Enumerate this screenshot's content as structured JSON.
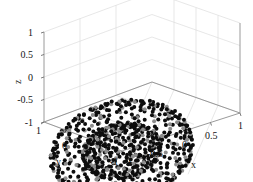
{
  "figure": {
    "kind": "matlab-3d-scatter",
    "background_color": "#ffffff",
    "grid_color": "#d8d8d8",
    "axis_color": "#9a9a9a",
    "marker_colors": {
      "primary": "#0d0d0d",
      "secondary": "#8c8c8c"
    }
  },
  "axes": {
    "x": {
      "name": "x",
      "ticks": [
        "-1",
        "-0.5",
        "0",
        "0.5",
        "1"
      ],
      "tick_values": [
        -1,
        -0.5,
        0,
        0.5,
        1
      ],
      "limits": [
        -1,
        1
      ]
    },
    "y": {
      "name": "y",
      "ticks": [
        "1",
        "0",
        "-1"
      ],
      "tick_values": [
        1,
        0,
        -1
      ],
      "limits": [
        -1,
        1
      ]
    },
    "z": {
      "name": "z",
      "ticks": [
        "1",
        "0.5",
        "0",
        "-0.5",
        "-1"
      ],
      "tick_values": [
        1,
        0.5,
        0,
        -0.5,
        -1
      ],
      "limits": [
        -1,
        1
      ]
    }
  },
  "chart_data": {
    "type": "scatter",
    "title": "",
    "xlabel": "x",
    "ylabel": "y",
    "zlabel": "z",
    "xlim": [
      -1,
      1
    ],
    "ylim": [
      -1,
      1
    ],
    "zlim": [
      -1,
      1
    ],
    "grid": true,
    "legend": null,
    "projection": "3d",
    "view": {
      "azimuth": -37.5,
      "elevation": 30
    },
    "series": [
      {
        "name": "outer-shell-black",
        "color": "#0d0d0d",
        "marker": "circle",
        "marker_size": 4,
        "radius": 1.0,
        "n_points": 420
      },
      {
        "name": "outer-shell-gray",
        "color": "#8c8c8c",
        "marker": "circle",
        "marker_size": 4,
        "radius": 1.0,
        "n_points": 140
      },
      {
        "name": "inner-shell-black",
        "color": "#0d0d0d",
        "marker": "circle",
        "marker_size": 4,
        "radius": 0.55,
        "n_points": 260
      },
      {
        "name": "inner-shell-gray",
        "color": "#8c8c8c",
        "marker": "circle",
        "marker_size": 4,
        "radius": 0.55,
        "n_points": 90
      }
    ]
  }
}
